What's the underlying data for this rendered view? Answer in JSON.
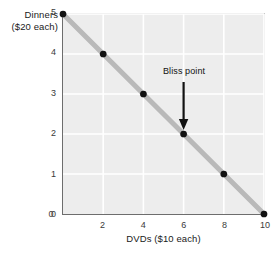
{
  "chart_data": {
    "type": "line",
    "title": "",
    "subtitle": "",
    "xlabel": "DVDs ($10 each)",
    "ylabel_lines": [
      "Dinners",
      "($20 each)"
    ],
    "ylabel": "Dinners ($20 each)",
    "xlim": [
      0,
      10
    ],
    "ylim": [
      0,
      5
    ],
    "xticks": [
      0,
      2,
      4,
      6,
      8,
      10
    ],
    "xtick_labels": [
      "0",
      "2",
      "4",
      "6",
      "8",
      "10"
    ],
    "yticks": [
      0,
      1,
      2,
      3,
      4,
      5
    ],
    "ytick_labels": [
      "0",
      "1",
      "2",
      "3",
      "4",
      "5"
    ],
    "grid": true,
    "grid_color": "#ffffff",
    "plot_bg": "#ededed",
    "legend": null,
    "legend_position": "none",
    "series": [
      {
        "name": "Budget constraint",
        "type": "line",
        "line_color": "#b9b9b9",
        "line_width": 5,
        "marker_color": "#111111",
        "x": [
          0,
          2,
          4,
          6,
          8,
          10
        ],
        "y": [
          5,
          4,
          3,
          2,
          1,
          0
        ],
        "points": [
          {
            "x": 0,
            "y": 5
          },
          {
            "x": 2,
            "y": 4
          },
          {
            "x": 4,
            "y": 3
          },
          {
            "x": 6,
            "y": 2
          },
          {
            "x": 8,
            "y": 1
          },
          {
            "x": 10,
            "y": 0
          }
        ]
      }
    ],
    "annotations": [
      {
        "name": "bliss-point",
        "text": "Bliss point",
        "text_x": 6,
        "text_y": 3.45,
        "arrow_from": {
          "x": 6,
          "y": 3.3
        },
        "arrow_to": {
          "x": 6,
          "y": 2.1
        },
        "arrow_color": "#111111"
      }
    ]
  },
  "axis": {
    "line_color": "#6d6d6d"
  }
}
